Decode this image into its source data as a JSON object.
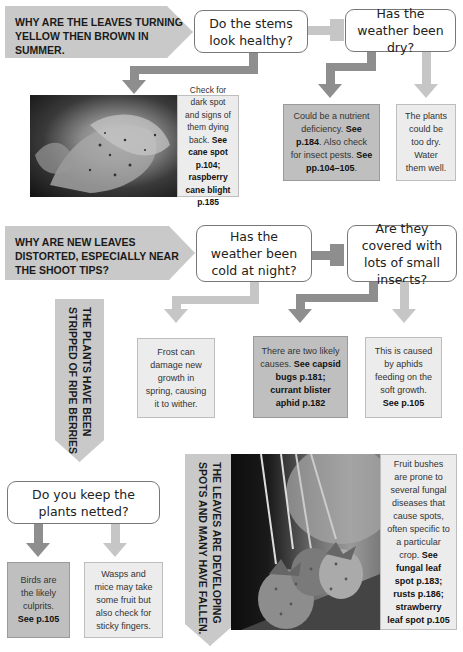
{
  "section1": {
    "banner": "WHY ARE THE LEAVES TURNING YELLOW THEN BROWN IN SUMMER.",
    "q1": "Do the stems look healthy?",
    "q2": "Has the weather been dry?",
    "photo_answer": {
      "text": "Check for dark spot and signs of them dying back.",
      "ref": "See cane spot p.104; raspberry cane blight p.185"
    },
    "answer_nutrient": {
      "t1": "Could be a nutrient deficiency. ",
      "r1": "See p.184",
      "t2": ". Also check for insect pests. ",
      "r2": "See pp.104–105",
      "t3": "."
    },
    "answer_dry": "The plants could be too dry. Water them well."
  },
  "section2": {
    "banner": "WHY ARE NEW LEAVES DISTORTED, ESPECIALLY NEAR THE SHOOT TIPS?",
    "q1": "Has the weather been cold at night?",
    "q2": "Are they covered with lots of small insects?",
    "answer_frost": "Frost can damage new growth in spring, causing it to wither.",
    "answer_two": {
      "t1": "There are two likely causes. ",
      "ref": "See capsid bugs p.181; currant blister aphid p.182"
    },
    "answer_aphid": {
      "t1": "This is caused by aphids feeding on the soft growth. ",
      "ref": "See p.105"
    }
  },
  "section3": {
    "banner": "THE PLANTS HAVE BEEN\nSTRIPPED OF RIPE BERRIES.",
    "q1": "Do you keep the plants netted?",
    "answer_birds": {
      "t1": "Birds are the likely culprits. ",
      "ref": "See p.105"
    },
    "answer_wasps": "Wasps and mice may take some fruit but also check for sticky fingers."
  },
  "section4": {
    "banner": "THE LEAVES ARE DEVELOPING\nSPOTS AND MANY HAVE FALLEN.",
    "answer": {
      "t1": "Fruit bushes are prone to several fungal diseases that cause spots, often specific to a particular crop. ",
      "ref": "See fungal leaf spot p.183; rusts p.186; strawberry leaf spot p.105"
    }
  },
  "colors": {
    "banner": "#c9c9c9",
    "arrow_dark": "#8e8e8e",
    "arrow_light": "#c6c6c6",
    "answer_dark": "#bfbfbf",
    "answer_light": "#ececec"
  }
}
